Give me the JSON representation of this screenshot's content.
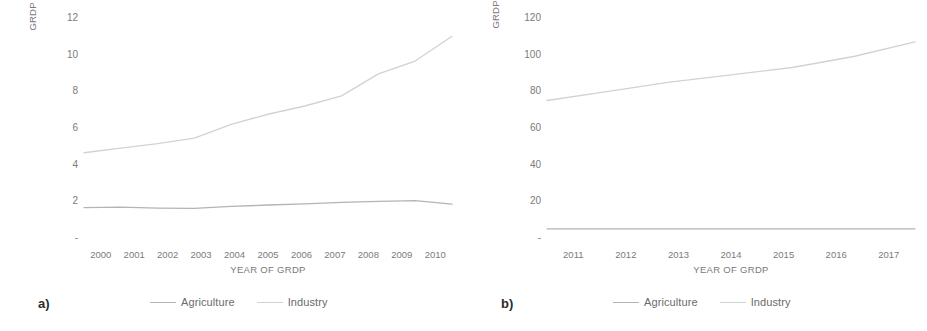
{
  "figure": {
    "background": "#ffffff",
    "series_colors": {
      "agriculture": "#b4b4b4",
      "industry": "#d2d2d2"
    }
  },
  "panels": [
    {
      "tag": "a)",
      "legend": [
        {
          "label": "Agriculture",
          "color": "#b4b4b4"
        },
        {
          "label": "Industry",
          "color": "#d2d2d2"
        }
      ]
    },
    {
      "tag": "b)",
      "legend": [
        {
          "label": "Agriculture",
          "color": "#b4b4b4"
        },
        {
          "label": "Industry",
          "color": "#d2d2d2"
        }
      ]
    }
  ],
  "chart_data": [
    {
      "type": "line",
      "title": "",
      "xlabel": "YEAR OF GRDP",
      "ylabel": "GRDP (IN TRILLION RUPIAHS)",
      "categories": [
        "2000",
        "2001",
        "2002",
        "2003",
        "2004",
        "2005",
        "2006",
        "2007",
        "2008",
        "2009",
        "2010"
      ],
      "ytick_labels": [
        "-",
        "2",
        "4",
        "6",
        "8",
        "10",
        "12"
      ],
      "ytick_values": [
        0,
        2,
        4,
        6,
        8,
        10,
        12
      ],
      "ylim": [
        0,
        12
      ],
      "grid": false,
      "legend_position": "bottom",
      "series": [
        {
          "name": "Agriculture",
          "color": "#b4b4b4",
          "values": [
            1.66,
            1.68,
            1.63,
            1.62,
            1.72,
            1.8,
            1.86,
            1.94,
            2.0,
            2.04,
            1.85
          ]
        },
        {
          "name": "Industry",
          "color": "#d2d2d2",
          "values": [
            4.65,
            4.9,
            5.15,
            5.45,
            6.2,
            6.75,
            7.2,
            7.75,
            8.95,
            9.65,
            11.0
          ]
        }
      ]
    },
    {
      "type": "line",
      "title": "",
      "xlabel": "YEAR OF GRDP",
      "ylabel": "GRDP (IN TRILLION RUPIAHS)",
      "categories": [
        "2011",
        "2012",
        "2013",
        "2014",
        "2015",
        "2016",
        "2017"
      ],
      "ytick_labels": [
        "-",
        "20",
        "40",
        "60",
        "80",
        "100",
        "120"
      ],
      "ytick_values": [
        0,
        20,
        40,
        60,
        80,
        100,
        120
      ],
      "ylim": [
        0,
        120
      ],
      "grid": false,
      "legend_position": "bottom",
      "series": [
        {
          "name": "Agriculture",
          "color": "#b4b4b4",
          "values": [
            5.0,
            5.0,
            5.0,
            5.0,
            5.0,
            5.0,
            5.0
          ]
        },
        {
          "name": "Industry",
          "color": "#d2d2d2",
          "values": [
            75,
            80,
            85,
            89,
            93,
            99,
            107
          ]
        }
      ]
    }
  ]
}
